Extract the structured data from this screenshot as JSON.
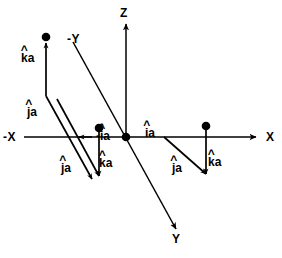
{
  "figure": {
    "type": "vector-diagram",
    "title": "",
    "background_color": "#ffffff",
    "stroke_color": "#000000",
    "width": 282,
    "height": 258
  },
  "axes": [
    {
      "name": "x-axis",
      "label": "X",
      "label_x": 266,
      "label_y": 140,
      "direction": "right"
    },
    {
      "name": "negative-x-axis",
      "label": "-X",
      "label_x": 4,
      "label_y": 140,
      "direction": "left"
    },
    {
      "name": "z-axis",
      "label": "Z",
      "label_x": 120,
      "label_y": 13,
      "direction": "up"
    },
    {
      "name": "y-axis",
      "label": "Y",
      "label_x": 173,
      "label_y": 240,
      "direction": "down-right"
    },
    {
      "name": "negative-y-axis",
      "label": "-Y",
      "label_x": 68,
      "label_y": 39,
      "direction": "up-left"
    }
  ],
  "vector_labels": [
    {
      "name": "k-hat-a-left-upper",
      "hat": "^",
      "base": "k",
      "suffix": "a",
      "sign": "",
      "x": 22,
      "y": 53
    },
    {
      "name": "j-hat-a-left-upper",
      "hat": "^",
      "base": "j",
      "suffix": "a",
      "sign": "",
      "x": 28,
      "y": 107
    },
    {
      "name": "j-hat-a-left-lower",
      "hat": "^",
      "base": "j",
      "suffix": "a",
      "sign": "",
      "x": 62,
      "y": 163
    },
    {
      "name": "k-hat-a-left-lower",
      "hat": "^",
      "base": "k",
      "suffix": "a",
      "sign": "",
      "x": 100,
      "y": 158
    },
    {
      "name": "negative-i-hat-a",
      "hat": "^",
      "base": "i",
      "suffix": "a",
      "sign": "-",
      "x": 97,
      "y": 131
    },
    {
      "name": "i-hat-a",
      "hat": "^",
      "base": "i",
      "suffix": "a",
      "sign": "",
      "x": 145,
      "y": 128
    },
    {
      "name": "j-hat-a-right",
      "hat": "^",
      "base": "j",
      "suffix": "a",
      "sign": "",
      "x": 173,
      "y": 163
    },
    {
      "name": "k-hat-a-right",
      "hat": "^",
      "base": "k",
      "suffix": "a",
      "sign": "",
      "x": 209,
      "y": 157
    }
  ],
  "geometry": {
    "origin": {
      "x": 126,
      "y": 137
    },
    "x_axis_line": {
      "x1": 24,
      "y1": 137,
      "x2": 258,
      "y2": 137
    },
    "x_axis_arrow_tip": {
      "x": 258,
      "y": 137
    },
    "x_axis_inner_arrow_tip": {
      "x": 78,
      "y": 137
    },
    "z_axis_line": {
      "x1": 126,
      "y1": 22,
      "x2": 126,
      "y2": 137
    },
    "y_axis_line": {
      "x1": 73,
      "y1": 42,
      "x2": 178,
      "y2": 232
    },
    "triads": [
      {
        "name": "triad-left-outer",
        "dot": {
          "x": 46,
          "y": 37
        },
        "k_vector": {
          "x1": 46,
          "y1": 96,
          "x2": 46,
          "y2": 40
        },
        "j_vector": {
          "x1": 46,
          "y1": 96,
          "x2": 93,
          "y2": 180
        }
      },
      {
        "name": "triad-center-left",
        "dot": {
          "x": 99,
          "y": 128
        },
        "k_vector": {
          "x1": 99,
          "y1": 130,
          "x2": 99,
          "y2": 177
        },
        "j_vector": {
          "x1": 57,
          "y1": 99,
          "x2": 99,
          "y2": 177
        }
      },
      {
        "name": "triad-right",
        "dot": {
          "x": 206,
          "y": 126
        },
        "k_vector": {
          "x1": 206,
          "y1": 128,
          "x2": 206,
          "y2": 175
        },
        "j_vector": {
          "x1": 164,
          "y1": 137,
          "x2": 206,
          "y2": 175
        }
      }
    ],
    "dot_radius": 4.2,
    "line_width": 1.6
  }
}
